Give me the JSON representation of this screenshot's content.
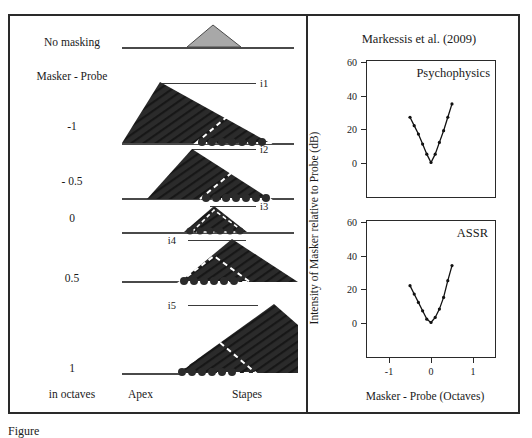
{
  "figure": {
    "reference_title": "Markessis et al. (2009)",
    "caption_partial": "Figure"
  },
  "left_panel": {
    "header_labels": [
      {
        "text": "No masking",
        "y": 26
      },
      {
        "text": "Masker - Probe",
        "y": 60
      }
    ],
    "axis_bottom_left": "in octaves",
    "axis_bottom_center": "Apex",
    "axis_bottom_right": "Stapes",
    "rows": [
      {
        "label": "-1",
        "marker": "i1"
      },
      {
        "label": "- 0.5",
        "marker": "i2"
      },
      {
        "label": "0",
        "marker": "i3"
      },
      {
        "label": "0.5",
        "marker": "i4"
      },
      {
        "label": "1",
        "marker": "i5"
      }
    ],
    "probe_marker": "",
    "probe_fill": "#a8a8a8",
    "masker_fill": "#2b2b2b",
    "baseline_color": "#4a4a4a"
  },
  "charts": {
    "ylabel": "Intensity of Masker relative to Probe (dB)",
    "xlabel": "Masker - Probe (Octaves)"
  },
  "chart_data": [
    {
      "type": "line",
      "title": "Psychophysics",
      "xlabel": "Masker - Probe (Octaves)",
      "ylabel": "Intensity of Masker relative to Probe (dB)",
      "xlim": [
        -1.5,
        1.5
      ],
      "ylim": [
        -20,
        60
      ],
      "xticks": [
        -1,
        0,
        1
      ],
      "yticks": [
        0,
        20,
        40,
        60
      ],
      "grid": false,
      "legend": "none",
      "x": [
        -0.5,
        -0.4,
        -0.3,
        -0.2,
        -0.1,
        0.0,
        0.1,
        0.2,
        0.3,
        0.4,
        0.5
      ],
      "y": [
        27,
        22,
        17,
        11,
        5,
        0,
        5,
        12,
        19,
        27,
        35
      ]
    },
    {
      "type": "line",
      "title": "ASSR",
      "xlabel": "Masker - Probe (Octaves)",
      "ylabel": "Intensity of Masker relative to Probe (dB)",
      "xlim": [
        -1.5,
        1.5
      ],
      "ylim": [
        -20,
        60
      ],
      "xticks": [
        -1,
        0,
        1
      ],
      "yticks": [
        0,
        20,
        40,
        60
      ],
      "grid": false,
      "legend": "none",
      "x": [
        -0.5,
        -0.4,
        -0.3,
        -0.2,
        -0.1,
        0.0,
        0.1,
        0.2,
        0.3,
        0.4,
        0.5
      ],
      "y": [
        22,
        17,
        12,
        7,
        2,
        0,
        3,
        8,
        15,
        25,
        34
      ]
    }
  ]
}
